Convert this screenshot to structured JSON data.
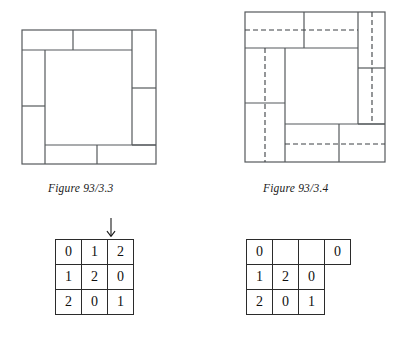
{
  "figures": [
    {
      "id": "figure-93-3-3",
      "caption": "Figure 93/3.3",
      "description": "square-frame pinwheel dissection, solid lines only",
      "dashed": false
    },
    {
      "id": "figure-93-3-4",
      "caption": "Figure 93/3.4",
      "description": "square-frame pinwheel dissection with dashed construction lines",
      "dashed": true
    }
  ],
  "arrow": {
    "name": "down-arrow",
    "glyph": "↓"
  },
  "grids": [
    {
      "id": "grid-left",
      "rows": [
        [
          "0",
          "1",
          "2"
        ],
        [
          "1",
          "2",
          "0"
        ],
        [
          "2",
          "0",
          "1"
        ]
      ]
    },
    {
      "id": "grid-right",
      "rows": [
        [
          "0",
          "",
          "",
          "0"
        ],
        [
          "1",
          "2",
          "0"
        ],
        [
          "2",
          "0",
          "1"
        ]
      ]
    }
  ],
  "colors": {
    "line": "#55595c",
    "grid_line": "#2b2b2b",
    "text": "#101010",
    "background": "#ffffff"
  }
}
